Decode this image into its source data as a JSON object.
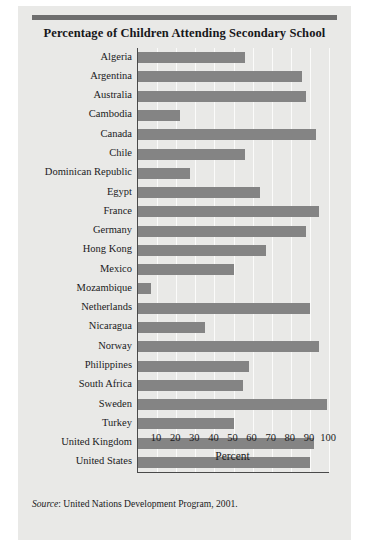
{
  "figure": {
    "title": "Percentage of Children Attending Secondary School",
    "source_keyword": "Source",
    "source_text": ": United Nations Development Program, 2001.",
    "bar_color": "#848484",
    "background_color": "#e9e9e7",
    "rule_color": "#6e6e6e",
    "axis_color": "#4a4a4a"
  },
  "chart_data": {
    "type": "bar",
    "orientation": "horizontal",
    "title": "Percentage of Children Attending Secondary School",
    "xlabel": "Percent",
    "ylabel": "",
    "xlim": [
      0,
      100
    ],
    "xticks": [
      10,
      20,
      30,
      40,
      50,
      60,
      70,
      80,
      90,
      100
    ],
    "grid": true,
    "legend": "none",
    "categories": [
      "Algeria",
      "Argentina",
      "Australia",
      "Cambodia",
      "Canada",
      "Chile",
      "Dominican Republic",
      "Egypt",
      "France",
      "Germany",
      "Hong Kong",
      "Mexico",
      "Mozambique",
      "Netherlands",
      "Nicaragua",
      "Norway",
      "Philippines",
      "South Africa",
      "Sweden",
      "Turkey",
      "United Kingdom",
      "United States"
    ],
    "values": [
      56,
      86,
      88,
      22,
      93,
      56,
      27,
      64,
      95,
      88,
      67,
      50,
      7,
      90,
      35,
      95,
      58,
      55,
      99,
      50,
      92,
      90
    ],
    "annotations": [
      "Source: United Nations Development Program, 2001."
    ]
  }
}
